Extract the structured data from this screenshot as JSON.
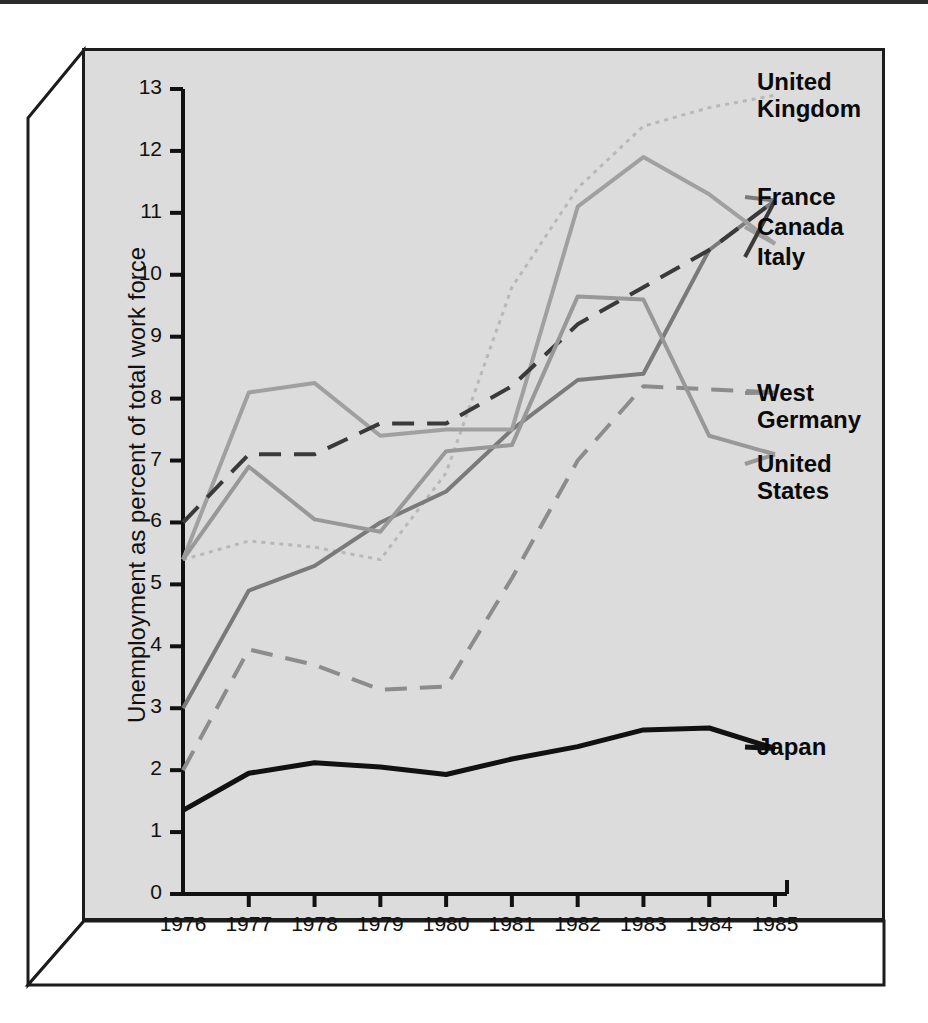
{
  "chart_data": {
    "type": "line",
    "title": "",
    "xlabel": "",
    "ylabel": "Unemployment as percent of total work force",
    "x": [
      1976,
      1977,
      1978,
      1979,
      1980,
      1981,
      1982,
      1983,
      1984,
      1985
    ],
    "xtick_labels": [
      "1976",
      "1977",
      "1978",
      "1979",
      "1980",
      "1981",
      "1982",
      "1983",
      "1984",
      "1985"
    ],
    "ytick_labels": [
      "0",
      "1",
      "2",
      "3",
      "4",
      "5",
      "6",
      "7",
      "8",
      "9",
      "10",
      "11",
      "12",
      "13"
    ],
    "ylim": [
      0,
      13
    ],
    "xlim": [
      1976,
      1985
    ],
    "grid": false,
    "legend_position": "right-inline-annotations",
    "series": [
      {
        "name": "United Kingdom",
        "values": [
          5.4,
          5.7,
          5.6,
          5.4,
          6.8,
          9.8,
          11.4,
          12.4,
          12.7,
          12.9
        ],
        "style": "dotted",
        "color": "#b8b8b8"
      },
      {
        "name": "France",
        "values": [
          3.0,
          4.9,
          5.3,
          6.0,
          6.5,
          7.5,
          8.3,
          8.4,
          10.4,
          11.2
        ],
        "style": "solid",
        "color": "#7a7a7a"
      },
      {
        "name": "Canada",
        "values": [
          5.4,
          8.1,
          8.25,
          7.4,
          7.5,
          7.5,
          11.1,
          11.9,
          11.3,
          10.5
        ],
        "style": "solid",
        "color": "#a0a0a0"
      },
      {
        "name": "Italy",
        "values": [
          6.0,
          7.1,
          7.1,
          7.6,
          7.6,
          8.2,
          9.2,
          9.8,
          10.4,
          11.2
        ],
        "style": "dashed",
        "color": "#3a3a3a"
      },
      {
        "name": "West Germany",
        "values": [
          2.0,
          3.95,
          3.7,
          3.3,
          3.35,
          5.1,
          7.0,
          8.2,
          8.15,
          8.1
        ],
        "style": "dashed",
        "color": "#8c8c8c"
      },
      {
        "name": "United States",
        "values": [
          5.4,
          6.9,
          6.05,
          5.85,
          7.15,
          7.25,
          9.65,
          9.6,
          7.4,
          7.1
        ],
        "style": "solid",
        "color": "#989898"
      },
      {
        "name": "Japan",
        "values": [
          1.35,
          1.95,
          2.12,
          2.05,
          1.93,
          2.18,
          2.38,
          2.65,
          2.68,
          2.35
        ],
        "style": "solid",
        "color": "#111111"
      }
    ],
    "annotations": [
      {
        "text": "United\nKingdom",
        "series": "United Kingdom"
      },
      {
        "text": "France",
        "series": "France"
      },
      {
        "text": "Canada",
        "series": "Canada"
      },
      {
        "text": "Italy",
        "series": "Italy"
      },
      {
        "text": "West\nGermany",
        "series": "West Germany"
      },
      {
        "text": "United\nStates",
        "series": "United States"
      },
      {
        "text": "Japan",
        "series": "Japan"
      }
    ]
  },
  "colors": {
    "panel_background": "#dcdcdc",
    "frame": "#1c1c1c",
    "page_background": "#ffffff",
    "text": "#111111"
  }
}
